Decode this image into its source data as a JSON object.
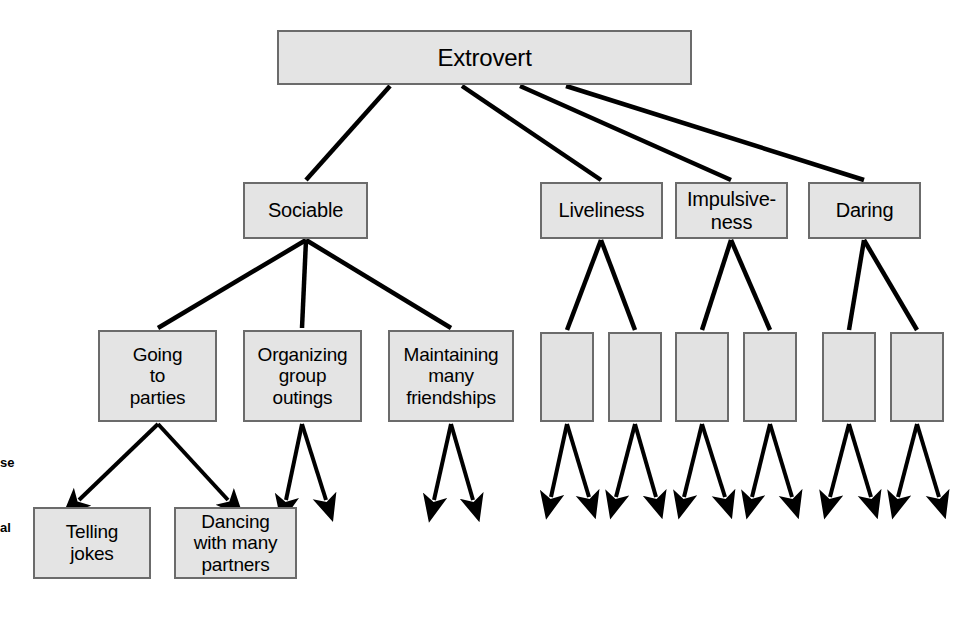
{
  "diagram": {
    "style": {
      "box_fill": "#e4e4e4",
      "box_border": "#6b6b6b",
      "line_color": "#000000",
      "background": "#ffffff"
    },
    "levels": [
      {
        "name": "type-level",
        "nodes": [
          {
            "id": "extrovert",
            "label": "Extrovert",
            "x": 277,
            "y": 30,
            "w": 415,
            "h": 55,
            "font_size": 24,
            "blank": false
          }
        ]
      },
      {
        "name": "trait-level",
        "nodes": [
          {
            "id": "sociable",
            "label": "Sociable",
            "x": 243,
            "y": 182,
            "w": 125,
            "h": 57,
            "font_size": 20,
            "blank": false
          },
          {
            "id": "liveliness",
            "label": "Liveliness",
            "x": 540,
            "y": 182,
            "w": 123,
            "h": 57,
            "font_size": 20,
            "blank": false
          },
          {
            "id": "impulsiveness",
            "label": "Impulsive-\nness",
            "x": 675,
            "y": 182,
            "w": 113,
            "h": 57,
            "font_size": 20,
            "blank": false
          },
          {
            "id": "daring",
            "label": "Daring",
            "x": 808,
            "y": 182,
            "w": 113,
            "h": 57,
            "font_size": 20,
            "blank": false
          }
        ]
      },
      {
        "name": "habitual-response-level",
        "nodes": [
          {
            "id": "going-to-parties",
            "label": "Going\nto\nparties",
            "x": 98,
            "y": 330,
            "w": 119,
            "h": 92,
            "font_size": 19,
            "blank": false
          },
          {
            "id": "organizing-group-outings",
            "label": "Organizing\ngroup\noutings",
            "x": 243,
            "y": 330,
            "w": 119,
            "h": 92,
            "font_size": 19,
            "blank": false
          },
          {
            "id": "maintaining-many-friendships",
            "label": "Maintaining\nmany\nfriendships",
            "x": 388,
            "y": 330,
            "w": 126,
            "h": 92,
            "font_size": 19,
            "blank": false
          },
          {
            "id": "habit-blank-1",
            "label": "",
            "x": 540,
            "y": 332,
            "w": 54,
            "h": 90,
            "font_size": 19,
            "blank": true
          },
          {
            "id": "habit-blank-2",
            "label": "",
            "x": 608,
            "y": 332,
            "w": 54,
            "h": 90,
            "font_size": 19,
            "blank": true
          },
          {
            "id": "habit-blank-3",
            "label": "",
            "x": 675,
            "y": 332,
            "w": 54,
            "h": 90,
            "font_size": 19,
            "blank": true
          },
          {
            "id": "habit-blank-4",
            "label": "",
            "x": 743,
            "y": 332,
            "w": 54,
            "h": 90,
            "font_size": 19,
            "blank": true
          },
          {
            "id": "habit-blank-5",
            "label": "",
            "x": 822,
            "y": 332,
            "w": 54,
            "h": 90,
            "font_size": 19,
            "blank": true
          },
          {
            "x": 890,
            "y": 332,
            "w": 54,
            "h": 90,
            "id": "habit-blank-6",
            "label": "",
            "font_size": 19,
            "blank": true
          }
        ]
      },
      {
        "name": "specific-response-level",
        "nodes": [
          {
            "id": "telling-jokes",
            "label": "Telling\njokes",
            "x": 33,
            "y": 507,
            "w": 118,
            "h": 72,
            "font_size": 19,
            "blank": false
          },
          {
            "id": "dancing-with-many-partners",
            "label": "Dancing\nwith many\npartners",
            "x": 174,
            "y": 507,
            "w": 123,
            "h": 72,
            "font_size": 19,
            "blank": false
          }
        ]
      }
    ],
    "edges": [
      {
        "from": "extrovert",
        "to": "sociable",
        "x1": 390,
        "y1": 86,
        "x2": 306,
        "y2": 180
      },
      {
        "from": "extrovert",
        "to": "liveliness",
        "x1": 462,
        "y1": 86,
        "x2": 601,
        "y2": 180
      },
      {
        "from": "extrovert",
        "to": "impulsiveness",
        "x1": 520,
        "y1": 86,
        "x2": 731,
        "y2": 180
      },
      {
        "from": "extrovert",
        "to": "daring",
        "x1": 566,
        "y1": 86,
        "x2": 864,
        "y2": 180
      },
      {
        "from": "sociable",
        "to": "going-to-parties",
        "x1": 306,
        "y1": 240,
        "x2": 158,
        "y2": 328
      },
      {
        "from": "sociable",
        "to": "organizing-group-outings",
        "x1": 306,
        "y1": 240,
        "x2": 302,
        "y2": 328
      },
      {
        "from": "sociable",
        "to": "maintaining-many-friendships",
        "x1": 306,
        "y1": 240,
        "x2": 451,
        "y2": 328
      },
      {
        "from": "liveliness",
        "to": "habit-blank-1",
        "x1": 601,
        "y1": 240,
        "x2": 567,
        "y2": 330
      },
      {
        "from": "liveliness",
        "to": "habit-blank-2",
        "x1": 601,
        "y1": 240,
        "x2": 635,
        "y2": 330
      },
      {
        "from": "impulsiveness",
        "to": "habit-blank-3",
        "x1": 731,
        "y1": 240,
        "x2": 702,
        "y2": 330
      },
      {
        "from": "impulsiveness",
        "to": "habit-blank-4",
        "x1": 731,
        "y1": 240,
        "x2": 770,
        "y2": 330
      },
      {
        "from": "daring",
        "to": "habit-blank-5",
        "x1": 864,
        "y1": 240,
        "x2": 849,
        "y2": 330
      },
      {
        "from": "daring",
        "to": "habit-blank-6",
        "x1": 864,
        "y1": 240,
        "x2": 917,
        "y2": 330
      }
    ],
    "arrows": [
      {
        "from": "going-to-parties",
        "x1": 158,
        "y1": 424,
        "x2": 79,
        "y2": 500
      },
      {
        "from": "going-to-parties",
        "x1": 158,
        "y1": 424,
        "x2": 228,
        "y2": 500
      },
      {
        "from": "organizing-group-outings",
        "x1": 302,
        "y1": 424,
        "x2": 286,
        "y2": 500
      },
      {
        "from": "organizing-group-outings",
        "x1": 302,
        "y1": 424,
        "x2": 326,
        "y2": 500
      },
      {
        "from": "maintaining-many-friendships",
        "x1": 451,
        "y1": 424,
        "x2": 434,
        "y2": 500
      },
      {
        "from": "maintaining-many-friendships",
        "x1": 451,
        "y1": 424,
        "x2": 473,
        "y2": 500
      },
      {
        "from": "habit-blank-1",
        "x1": 567,
        "y1": 424,
        "x2": 551,
        "y2": 497
      },
      {
        "from": "habit-blank-1",
        "x1": 567,
        "y1": 424,
        "x2": 589,
        "y2": 497
      },
      {
        "from": "habit-blank-2",
        "x1": 635,
        "y1": 424,
        "x2": 616,
        "y2": 497
      },
      {
        "from": "habit-blank-2",
        "x1": 635,
        "y1": 424,
        "x2": 656,
        "y2": 497
      },
      {
        "from": "habit-blank-3",
        "x1": 702,
        "y1": 424,
        "x2": 684,
        "y2": 497
      },
      {
        "from": "habit-blank-3",
        "x1": 702,
        "y1": 424,
        "x2": 725,
        "y2": 497
      },
      {
        "from": "habit-blank-4",
        "x1": 770,
        "y1": 424,
        "x2": 752,
        "y2": 497
      },
      {
        "from": "habit-blank-4",
        "x1": 770,
        "y1": 424,
        "x2": 792,
        "y2": 497
      },
      {
        "from": "habit-blank-5",
        "x1": 849,
        "y1": 424,
        "x2": 830,
        "y2": 497
      },
      {
        "from": "habit-blank-5",
        "x1": 849,
        "y1": 424,
        "x2": 871,
        "y2": 497
      },
      {
        "from": "habit-blank-6",
        "x1": 917,
        "y1": 424,
        "x2": 898,
        "y2": 497
      },
      {
        "from": "habit-blank-6",
        "x1": 917,
        "y1": 424,
        "x2": 939,
        "y2": 497
      }
    ],
    "margin_notes": [
      {
        "id": "margin-note-upper",
        "text": "se",
        "x": 0,
        "y": 455
      },
      {
        "id": "margin-note-lower",
        "text": "al",
        "x": 0,
        "y": 520
      }
    ]
  }
}
